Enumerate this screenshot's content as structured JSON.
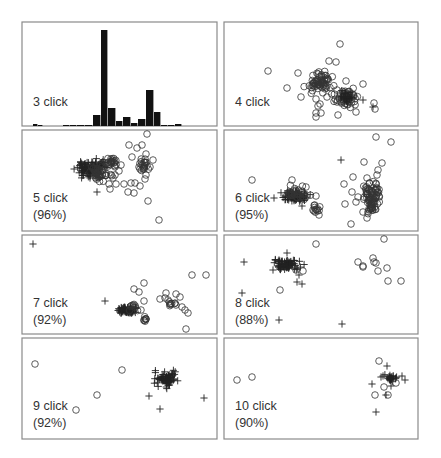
{
  "chart_data": {
    "type": "scatter",
    "title": "",
    "layout": {
      "rows": 4,
      "cols": 2,
      "grid": false,
      "legend": "none"
    },
    "marker_legend": {
      "circle": "misclassified / other",
      "plus": "target click class"
    },
    "panels": [
      {
        "id": "p3",
        "type": "bar",
        "label": "3 click",
        "accuracy": "",
        "frame": [
          22,
          22,
          195,
          104
        ],
        "bars": [
          {
            "x": 33,
            "w": 5,
            "h": 2
          },
          {
            "x": 38,
            "w": 5,
            "h": 1
          },
          {
            "x": 63,
            "w": 7,
            "h": 1
          },
          {
            "x": 70,
            "w": 7,
            "h": 1
          },
          {
            "x": 77,
            "w": 8,
            "h": 1
          },
          {
            "x": 85,
            "w": 8,
            "h": 1
          },
          {
            "x": 93,
            "w": 8,
            "h": 11
          },
          {
            "x": 101,
            "w": 7,
            "h": 96
          },
          {
            "x": 108,
            "w": 8,
            "h": 18
          },
          {
            "x": 116,
            "w": 7,
            "h": 5
          },
          {
            "x": 123,
            "w": 8,
            "h": 9
          },
          {
            "x": 131,
            "w": 7,
            "h": 3
          },
          {
            "x": 138,
            "w": 8,
            "h": 7
          },
          {
            "x": 146,
            "w": 8,
            "h": 36
          },
          {
            "x": 154,
            "w": 7,
            "h": 14
          },
          {
            "x": 161,
            "w": 7,
            "h": 1
          },
          {
            "x": 168,
            "w": 7,
            "h": 1
          },
          {
            "x": 175,
            "w": 7,
            "h": 2
          }
        ]
      },
      {
        "id": "p4",
        "type": "scatter",
        "label": "4 click",
        "accuracy": "",
        "frame": [
          224,
          22,
          194,
          104
        ],
        "clusters": [
          {
            "cx": 320,
            "cy": 82,
            "rx": 11,
            "ry": 9,
            "n": 60,
            "marker": "o"
          },
          {
            "cx": 346,
            "cy": 98,
            "rx": 10,
            "ry": 7,
            "n": 55,
            "marker": "o"
          },
          {
            "cx": 346,
            "cy": 97,
            "rx": 7,
            "ry": 5,
            "n": 20,
            "marker": "+"
          }
        ],
        "points": [
          [
            340,
            44,
            "o"
          ],
          [
            329,
            61,
            "o"
          ],
          [
            336,
            62,
            "o"
          ],
          [
            268,
            71,
            "o"
          ],
          [
            298,
            73,
            "o"
          ],
          [
            287,
            88,
            "o"
          ],
          [
            301,
            97,
            "o"
          ],
          [
            363,
            84,
            "o"
          ],
          [
            346,
            81,
            "o"
          ],
          [
            337,
            90,
            "o"
          ],
          [
            316,
            99,
            "o"
          ],
          [
            320,
            104,
            "o"
          ],
          [
            327,
            97,
            "o"
          ],
          [
            318,
            106,
            "o"
          ],
          [
            321,
            113,
            "o"
          ],
          [
            316,
            113,
            "o"
          ],
          [
            316,
            117,
            "o"
          ],
          [
            338,
            115,
            "o"
          ],
          [
            356,
            112,
            "o"
          ],
          [
            337,
            102,
            "o"
          ],
          [
            374,
            103,
            "o"
          ],
          [
            375,
            109,
            "o"
          ],
          [
            363,
            100,
            "+"
          ],
          [
            373,
            107,
            "+"
          ]
        ]
      },
      {
        "id": "p5",
        "type": "scatter",
        "label": "5 click",
        "accuracy": "(96%)",
        "frame": [
          22,
          130,
          195,
          101
        ],
        "clusters": [
          {
            "cx": 92,
            "cy": 168,
            "rx": 13,
            "ry": 7,
            "n": 110,
            "marker": "+"
          },
          {
            "cx": 100,
            "cy": 172,
            "rx": 10,
            "ry": 8,
            "n": 40,
            "marker": "o"
          },
          {
            "cx": 111,
            "cy": 162,
            "rx": 5,
            "ry": 5,
            "n": 20,
            "marker": "o"
          },
          {
            "cx": 143,
            "cy": 164,
            "rx": 4,
            "ry": 6,
            "n": 20,
            "marker": "o"
          }
        ],
        "points": [
          [
            147,
            134,
            "o"
          ],
          [
            129,
            145,
            "o"
          ],
          [
            137,
            148,
            "o"
          ],
          [
            142,
            145,
            "o"
          ],
          [
            132,
            157,
            "o"
          ],
          [
            146,
            154,
            "o"
          ],
          [
            153,
            160,
            "o"
          ],
          [
            139,
            167,
            "o"
          ],
          [
            150,
            167,
            "o"
          ],
          [
            146,
            175,
            "o"
          ],
          [
            145,
            179,
            "o"
          ],
          [
            121,
            165,
            "o"
          ],
          [
            119,
            171,
            "o"
          ],
          [
            115,
            175,
            "o"
          ],
          [
            113,
            178,
            "o"
          ],
          [
            109,
            184,
            "o"
          ],
          [
            116,
            184,
            "o"
          ],
          [
            124,
            184,
            "o"
          ],
          [
            131,
            183,
            "o"
          ],
          [
            135,
            183,
            "o"
          ],
          [
            140,
            186,
            "o"
          ],
          [
            128,
            192,
            "o"
          ],
          [
            134,
            193,
            "o"
          ],
          [
            110,
            189,
            "o"
          ],
          [
            148,
            201,
            "o"
          ],
          [
            159,
            220,
            "o"
          ],
          [
            97,
            192,
            "+"
          ],
          [
            90,
            178,
            "+"
          ]
        ]
      },
      {
        "id": "p6",
        "type": "scatter",
        "label": "6 click",
        "accuracy": "(95%)",
        "frame": [
          224,
          130,
          194,
          101
        ],
        "clusters": [
          {
            "cx": 295,
            "cy": 196,
            "rx": 11,
            "ry": 5,
            "n": 80,
            "marker": "+"
          },
          {
            "cx": 297,
            "cy": 193,
            "rx": 12,
            "ry": 6,
            "n": 30,
            "marker": "o"
          },
          {
            "cx": 316,
            "cy": 209,
            "rx": 3,
            "ry": 4,
            "n": 10,
            "marker": "o"
          },
          {
            "cx": 372,
            "cy": 198,
            "rx": 6,
            "ry": 16,
            "n": 80,
            "marker": "o"
          }
        ],
        "points": [
          [
            376,
            137,
            "o"
          ],
          [
            391,
            142,
            "o"
          ],
          [
            341,
            160,
            "+"
          ],
          [
            364,
            162,
            "o"
          ],
          [
            382,
            163,
            "o"
          ],
          [
            378,
            170,
            "o"
          ],
          [
            377,
            175,
            "o"
          ],
          [
            353,
            177,
            "o"
          ],
          [
            367,
            178,
            "o"
          ],
          [
            344,
            184,
            "o"
          ],
          [
            352,
            192,
            "o"
          ],
          [
            358,
            197,
            "o"
          ],
          [
            356,
            202,
            "o"
          ],
          [
            366,
            190,
            "o"
          ],
          [
            345,
            204,
            "o"
          ],
          [
            363,
            212,
            "o"
          ],
          [
            367,
            218,
            "o"
          ],
          [
            351,
            224,
            "o"
          ],
          [
            252,
            180,
            "o"
          ],
          [
            292,
            180,
            "o"
          ],
          [
            306,
            187,
            "o"
          ],
          [
            316,
            196,
            "o"
          ],
          [
            274,
            198,
            "+"
          ],
          [
            302,
            206,
            "+"
          ],
          [
            313,
            210,
            "o"
          ],
          [
            319,
            215,
            "o"
          ],
          [
            314,
            211,
            "o"
          ]
        ]
      },
      {
        "id": "p7",
        "type": "scatter",
        "label": "7 click",
        "accuracy": "(92%)",
        "frame": [
          22,
          235,
          195,
          99
        ],
        "clusters": [
          {
            "cx": 128,
            "cy": 310,
            "rx": 9,
            "ry": 4,
            "n": 70,
            "marker": "+"
          },
          {
            "cx": 134,
            "cy": 307,
            "rx": 4,
            "ry": 4,
            "n": 8,
            "marker": "o"
          },
          {
            "cx": 145,
            "cy": 318,
            "rx": 2,
            "ry": 3,
            "n": 8,
            "marker": "o"
          },
          {
            "cx": 172,
            "cy": 303,
            "rx": 3,
            "ry": 3,
            "n": 8,
            "marker": "o"
          }
        ],
        "points": [
          [
            33,
            244,
            "+"
          ],
          [
            192,
            275,
            "o"
          ],
          [
            206,
            275,
            "o"
          ],
          [
            144,
            283,
            "o"
          ],
          [
            134,
            289,
            "o"
          ],
          [
            139,
            292,
            "o"
          ],
          [
            166,
            293,
            "o"
          ],
          [
            176,
            294,
            "o"
          ],
          [
            165,
            298,
            "o"
          ],
          [
            160,
            299,
            "o"
          ],
          [
            180,
            297,
            "o"
          ],
          [
            168,
            300,
            "o"
          ],
          [
            144,
            301,
            "o"
          ],
          [
            105,
            301,
            "+"
          ],
          [
            176,
            305,
            "o"
          ],
          [
            182,
            307,
            "o"
          ],
          [
            185,
            310,
            "o"
          ],
          [
            188,
            313,
            "o"
          ],
          [
            141,
            310,
            "o"
          ],
          [
            186,
            329,
            "o"
          ]
        ]
      },
      {
        "id": "p8",
        "type": "scatter",
        "label": "8 click",
        "accuracy": "(88%)",
        "frame": [
          224,
          235,
          194,
          99
        ],
        "clusters": [
          {
            "cx": 287,
            "cy": 265,
            "rx": 12,
            "ry": 5,
            "n": 80,
            "marker": "+"
          }
        ],
        "points": [
          [
            316,
            244,
            "o"
          ],
          [
            384,
            239,
            "o"
          ],
          [
            244,
            262,
            "+"
          ],
          [
            287,
            253,
            "+"
          ],
          [
            273,
            270,
            "+"
          ],
          [
            299,
            275,
            "+"
          ],
          [
            297,
            282,
            "+"
          ],
          [
            302,
            284,
            "+"
          ],
          [
            296,
            270,
            "o"
          ],
          [
            303,
            271,
            "o"
          ],
          [
            358,
            262,
            "o"
          ],
          [
            373,
            258,
            "o"
          ],
          [
            363,
            267,
            "o"
          ],
          [
            374,
            262,
            "o"
          ],
          [
            376,
            263,
            "o"
          ],
          [
            378,
            271,
            "o"
          ],
          [
            363,
            266,
            "o"
          ],
          [
            388,
            281,
            "o"
          ],
          [
            401,
            281,
            "o"
          ],
          [
            387,
            268,
            "o"
          ],
          [
            280,
            290,
            "o"
          ],
          [
            242,
            293,
            "+"
          ],
          [
            279,
            320,
            "+"
          ],
          [
            342,
            324,
            "+"
          ]
        ]
      },
      {
        "id": "p9",
        "type": "scatter",
        "label": "9 click",
        "accuracy": "(92%)",
        "frame": [
          22,
          338,
          195,
          101
        ],
        "clusters": [
          {
            "cx": 166,
            "cy": 379,
            "rx": 11,
            "ry": 6,
            "n": 70,
            "marker": "+"
          }
        ],
        "points": [
          [
            35,
            364,
            "o"
          ],
          [
            122,
            370,
            "o"
          ],
          [
            97,
            395,
            "o"
          ],
          [
            76,
            410,
            "o"
          ],
          [
            149,
            396,
            "+"
          ],
          [
            160,
            409,
            "+"
          ],
          [
            204,
            398,
            "+"
          ]
        ]
      },
      {
        "id": "p10",
        "type": "scatter",
        "label": "10 click",
        "accuracy": "(90%)",
        "frame": [
          224,
          338,
          194,
          101
        ],
        "clusters": [
          {
            "cx": 391,
            "cy": 378,
            "rx": 5,
            "ry": 4,
            "n": 25,
            "marker": "+"
          }
        ],
        "points": [
          [
            237,
            380,
            "o"
          ],
          [
            252,
            377,
            "o"
          ],
          [
            379,
            361,
            "o"
          ],
          [
            387,
            366,
            "+"
          ],
          [
            383,
            376,
            "+"
          ],
          [
            381,
            377,
            "+"
          ],
          [
            402,
            376,
            "+"
          ],
          [
            405,
            380,
            "+"
          ],
          [
            396,
            383,
            "o"
          ],
          [
            384,
            387,
            "o"
          ],
          [
            372,
            384,
            "+"
          ],
          [
            391,
            386,
            "+"
          ],
          [
            388,
            395,
            "o"
          ],
          [
            386,
            395,
            "+"
          ],
          [
            375,
            395,
            "o"
          ],
          [
            376,
            412,
            "+"
          ]
        ]
      }
    ]
  }
}
